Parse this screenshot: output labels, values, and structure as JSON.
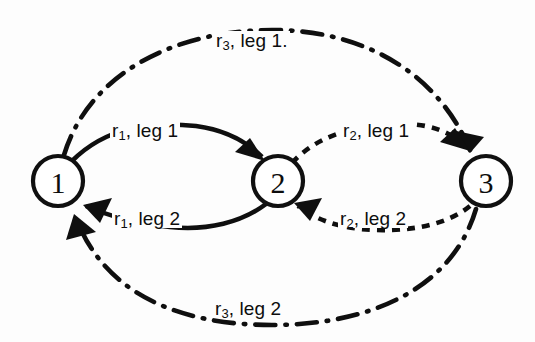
{
  "diagram": {
    "background_color": "#fdfdfd",
    "ink_color": "#0f0f0f",
    "nodes": [
      {
        "id": "1",
        "label": "1",
        "cx": 58,
        "cy": 181,
        "r": 25
      },
      {
        "id": "2",
        "label": "2",
        "cx": 278,
        "cy": 181,
        "r": 25
      },
      {
        "id": "3",
        "label": "3",
        "cx": 486,
        "cy": 181,
        "r": 25
      }
    ],
    "edges": [
      {
        "id": "r1-leg1",
        "from": "1",
        "to": "2",
        "label_text": "r",
        "label_sub": "1",
        "label_rest": ", leg 1",
        "style": "solid",
        "direction": "left-to-right",
        "position": "upper-inner-left"
      },
      {
        "id": "r1-leg2",
        "from": "2",
        "to": "1",
        "label_text": "r",
        "label_sub": "1",
        "label_rest": ", leg 2",
        "style": "solid",
        "direction": "right-to-left",
        "position": "lower-inner-left"
      },
      {
        "id": "r2-leg1",
        "from": "2",
        "to": "3",
        "label_text": "r",
        "label_sub": "2",
        "label_rest": ", leg 1",
        "style": "dotted",
        "direction": "left-to-right",
        "position": "upper-inner-right"
      },
      {
        "id": "r2-leg2",
        "from": "3",
        "to": "2",
        "label_text": "r",
        "label_sub": "2",
        "label_rest": ", leg 2",
        "style": "dotted",
        "direction": "right-to-left",
        "position": "lower-inner-right"
      },
      {
        "id": "r3-leg1",
        "from": "1",
        "to": "3",
        "label_text": "r",
        "label_sub": "3",
        "label_rest": ", leg 1.",
        "style": "dash-dot",
        "direction": "left-to-right",
        "position": "outer-top"
      },
      {
        "id": "r3-leg2",
        "from": "3",
        "to": "1",
        "label_text": "r",
        "label_sub": "3",
        "label_rest": ", leg 2",
        "style": "dash-dot",
        "direction": "right-to-left",
        "position": "outer-bottom"
      }
    ]
  }
}
